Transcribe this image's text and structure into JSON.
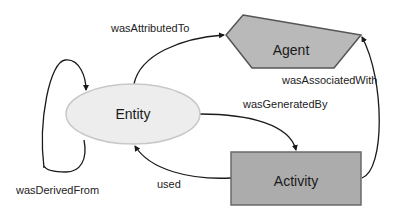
{
  "diagram": {
    "type": "provenance-model",
    "colors": {
      "agent_fill": "#b9b9b9",
      "agent_stroke": "#555555",
      "entity_fill": "#ededed",
      "entity_stroke": "#c8c8c8",
      "activity_fill": "#acacac",
      "activity_stroke": "#6a6a6a",
      "edge": "#1a1a1a"
    },
    "nodes": {
      "agent": {
        "label": "Agent",
        "shape": "pentagon"
      },
      "entity": {
        "label": "Entity",
        "shape": "ellipse"
      },
      "activity": {
        "label": "Activity",
        "shape": "rectangle"
      }
    },
    "edges": {
      "was_attributed_to": {
        "label": "wasAttributedTo",
        "from": "Entity",
        "to": "Agent"
      },
      "was_associated_with": {
        "label": "wasAssociatedWith",
        "from": "Activity",
        "to": "Agent"
      },
      "was_generated_by": {
        "label": "wasGeneratedBy",
        "from": "Entity",
        "to": "Activity"
      },
      "used": {
        "label": "used",
        "from": "Activity",
        "to": "Entity"
      },
      "was_derived_from": {
        "label": "wasDerivedFrom",
        "from": "Entity",
        "to": "Entity"
      }
    }
  }
}
